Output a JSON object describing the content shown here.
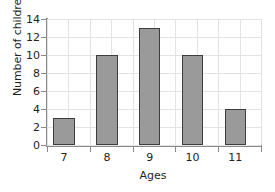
{
  "chart_data": {
    "type": "bar",
    "title": "",
    "xlabel": "Ages",
    "ylabel": "Number of children",
    "categories": [
      "7",
      "8",
      "9",
      "10",
      "11"
    ],
    "values": [
      3,
      10,
      13,
      10,
      4
    ],
    "ylim": [
      0,
      14
    ],
    "yticks": [
      0,
      2,
      4,
      6,
      8,
      10,
      12,
      14
    ],
    "ytick_labels": [
      "0",
      "2",
      "4",
      "6",
      "8",
      "10",
      "12",
      "14"
    ],
    "grid": true,
    "legend": null,
    "bar_color": "#9a9a9a",
    "bar_edge_color": "#3d3d3d",
    "grid_color": "#e3e3e3",
    "axis_color": "#8a8a8a",
    "text_color": "#231f20",
    "background": "#ffffff"
  }
}
